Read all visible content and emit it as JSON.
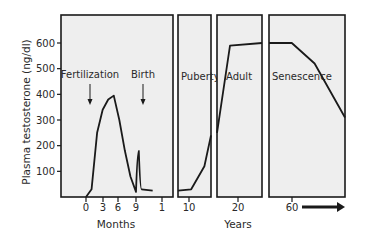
{
  "chart_data": {
    "type": "line",
    "title": "",
    "ylabel": "Plasma testosterone (ng/dl)",
    "ylim": [
      0,
      600
    ],
    "yticks": [
      100,
      200,
      300,
      400,
      500,
      600
    ],
    "grid": false,
    "xlabels": {
      "months": "Months",
      "years": "Years"
    },
    "panels": [
      {
        "name": "prenatal-infancy",
        "unit": "Months",
        "xticks": [
          {
            "label": "0",
            "x": 86
          },
          {
            "label": "3",
            "x": 103
          },
          {
            "label": "6",
            "x": 118
          },
          {
            "label": "9",
            "x": 136
          },
          {
            "label": "1",
            "x": 162
          }
        ],
        "annotations": [
          {
            "text": "Fertilization",
            "arrow": true,
            "x": 90,
            "y": 78
          },
          {
            "text": "Birth",
            "arrow": true,
            "x": 143,
            "y": 78
          }
        ],
        "series": [
          {
            "x_month": 0,
            "y": 0
          },
          {
            "x_month": 1,
            "y": 30
          },
          {
            "x_month": 2,
            "y": 250
          },
          {
            "x_month": 3,
            "y": 340
          },
          {
            "x_month": 4,
            "y": 380
          },
          {
            "x_month": 5,
            "y": 395
          },
          {
            "x_month": 6,
            "y": 300
          },
          {
            "x_month": 7,
            "y": 180
          },
          {
            "x_month": 8,
            "y": 80
          },
          {
            "x_month": 9,
            "y": 20
          },
          {
            "x_month": 9.5,
            "y": 180
          },
          {
            "x_month": 10,
            "y": 30
          },
          {
            "x_month": 12,
            "y": 25
          }
        ]
      },
      {
        "name": "puberty",
        "label": "Puberty",
        "unit": "Years",
        "xticks": [
          {
            "label": "10",
            "x": 189
          }
        ],
        "series": [
          {
            "x_year": 9,
            "y": 25
          },
          {
            "x_year": 11,
            "y": 30
          },
          {
            "x_year": 13,
            "y": 120
          },
          {
            "x_year": 14,
            "y": 240
          }
        ]
      },
      {
        "name": "adult",
        "label": "Adult",
        "unit": "Years",
        "xticks": [
          {
            "label": "20",
            "x": 238
          }
        ],
        "series": [
          {
            "x_year": 15,
            "y": 250
          },
          {
            "x_year": 18,
            "y": 590
          },
          {
            "x_year": 30,
            "y": 600
          }
        ]
      },
      {
        "name": "senescence",
        "label": "Senescence",
        "unit": "Years",
        "xticks": [
          {
            "label": "60",
            "x": 292
          }
        ],
        "arrow_after_tick": true,
        "series": [
          {
            "x_year": 40,
            "y": 600
          },
          {
            "x_year": 55,
            "y": 600
          },
          {
            "x_year": 70,
            "y": 520
          },
          {
            "x_year": 90,
            "y": 310
          }
        ]
      }
    ]
  }
}
